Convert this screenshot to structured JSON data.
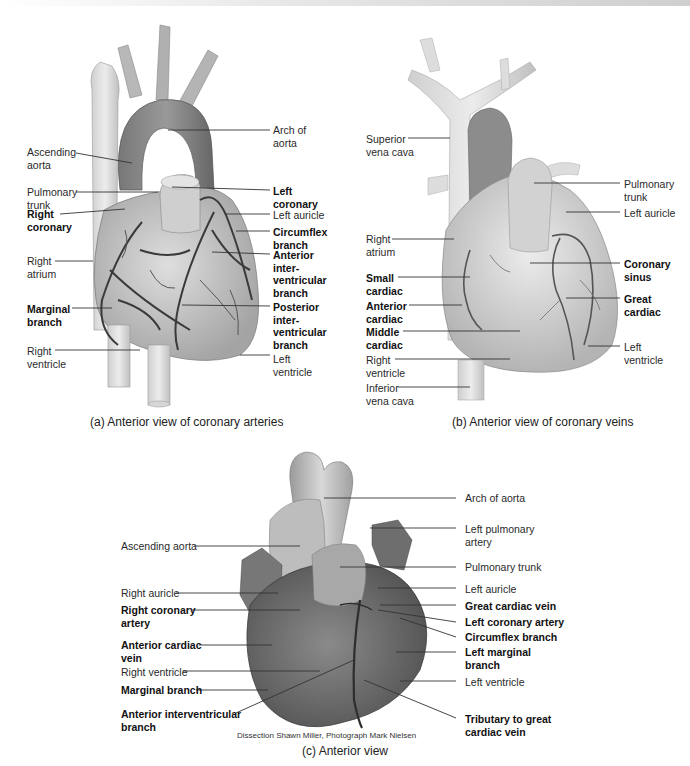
{
  "panels": {
    "a": {
      "caption": "(a) Anterior view of coronary arteries",
      "labels_left": [
        {
          "text1": "Ascending",
          "text2": "aorta",
          "bold": false
        },
        {
          "text1": "Pulmonary",
          "text2": "trunk",
          "bold": false
        },
        {
          "text1": "Right",
          "text2": "coronary",
          "bold": true
        },
        {
          "text1": "Right",
          "text2": "atrium",
          "bold": false
        },
        {
          "text1": "Marginal",
          "text2": "branch",
          "bold": true
        },
        {
          "text1": "Right",
          "text2": "ventricle",
          "bold": false
        }
      ],
      "labels_right": [
        {
          "text1": "Arch of",
          "text2": "aorta",
          "bold": false
        },
        {
          "text1": "Left",
          "text2": "coronary",
          "bold": true
        },
        {
          "text1": "Left auricle",
          "text2": "",
          "bold": false
        },
        {
          "text1": "Circumflex",
          "text2": "branch",
          "bold": true
        },
        {
          "text1": "Anterior",
          "text2": "inter-",
          "text3": "ventricular",
          "text4": "branch",
          "bold": true
        },
        {
          "text1": "Posterior",
          "text2": "inter-",
          "text3": "ventricular",
          "text4": "branch",
          "bold": true
        },
        {
          "text1": "Left",
          "text2": "ventricle",
          "bold": false
        }
      ]
    },
    "b": {
      "caption": "(b) Anterior view of coronary veins",
      "labels_left": [
        {
          "text1": "Superior",
          "text2": "vena cava",
          "bold": false
        },
        {
          "text1": "Right",
          "text2": "atrium",
          "bold": false
        },
        {
          "text1": "Small",
          "text2": "cardiac",
          "bold": true
        },
        {
          "text1": "Anterior",
          "text2": "cardiac",
          "bold": true
        },
        {
          "text1": "Middle",
          "text2": "cardiac",
          "bold": true
        },
        {
          "text1": "Right",
          "text2": "ventricle",
          "bold": false
        },
        {
          "text1": "Inferior",
          "text2": "vena cava",
          "bold": false
        }
      ],
      "labels_right": [
        {
          "text1": "Pulmonary",
          "text2": "trunk",
          "bold": false
        },
        {
          "text1": "Left auricle",
          "text2": "",
          "bold": false
        },
        {
          "text1": "Coronary",
          "text2": "sinus",
          "bold": true
        },
        {
          "text1": "Great",
          "text2": "cardiac",
          "bold": true
        },
        {
          "text1": "Left",
          "text2": "ventricle",
          "bold": false
        }
      ]
    },
    "c": {
      "caption": "(c) Anterior view",
      "credit": "Dissection Shawn Miller, Photograph Mark Nielsen",
      "labels_left": [
        {
          "text1": "Ascending aorta",
          "text2": "",
          "bold": false
        },
        {
          "text1": "Right auricle",
          "text2": "",
          "bold": false
        },
        {
          "text1": "Right coronary",
          "text2": "artery",
          "bold": true
        },
        {
          "text1": "Anterior cardiac",
          "text2": "vein",
          "bold": true
        },
        {
          "text1": "Right ventricle",
          "text2": "",
          "bold": false
        },
        {
          "text1": "Marginal branch",
          "text2": "",
          "bold": true
        },
        {
          "text1": "Anterior interventricular",
          "text2": "branch",
          "bold": true
        }
      ],
      "labels_right": [
        {
          "text1": "Arch of aorta",
          "text2": "",
          "bold": false
        },
        {
          "text1": "Left pulmonary",
          "text2": "artery",
          "bold": false
        },
        {
          "text1": "Pulmonary trunk",
          "text2": "",
          "bold": false
        },
        {
          "text1": "Left auricle",
          "text2": "",
          "bold": false
        },
        {
          "text1": "Great cardiac vein",
          "text2": "",
          "bold": true
        },
        {
          "text1": "Left coronary artery",
          "text2": "",
          "bold": true
        },
        {
          "text1": "Circumflex branch",
          "text2": "",
          "bold": true
        },
        {
          "text1": "Left marginal",
          "text2": "branch",
          "bold": true
        },
        {
          "text1": "Left ventricle",
          "text2": "",
          "bold": false
        },
        {
          "text1": "Tributary to great",
          "text2": "cardiac vein",
          "bold": true
        }
      ]
    }
  }
}
